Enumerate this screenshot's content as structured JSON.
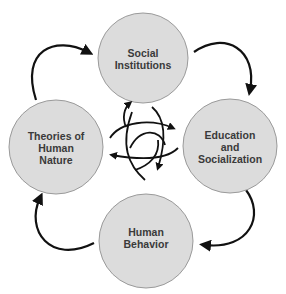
{
  "diagram": {
    "type": "cycle",
    "colors": {
      "node_fill": "#dcdcdc",
      "node_stroke": "#9a9a9a",
      "arrow": "#111111",
      "text": "#3a3a3a",
      "background": "#ffffff"
    },
    "nodes": [
      {
        "id": "social-institutions",
        "lines": [
          "Social",
          "Institutions"
        ]
      },
      {
        "id": "education-socialization",
        "lines": [
          "Education",
          "and",
          "Socialization"
        ]
      },
      {
        "id": "human-behavior",
        "lines": [
          "Human",
          "Behavior"
        ]
      },
      {
        "id": "theories-human-nature",
        "lines": [
          "Theories of",
          "Human",
          "Nature"
        ]
      }
    ],
    "edges": [
      {
        "from": "social-institutions",
        "to": "education-socialization"
      },
      {
        "from": "education-socialization",
        "to": "human-behavior"
      },
      {
        "from": "human-behavior",
        "to": "theories-human-nature"
      },
      {
        "from": "theories-human-nature",
        "to": "social-institutions"
      }
    ],
    "center_symbol": "interlinked-cycle-arrows"
  }
}
